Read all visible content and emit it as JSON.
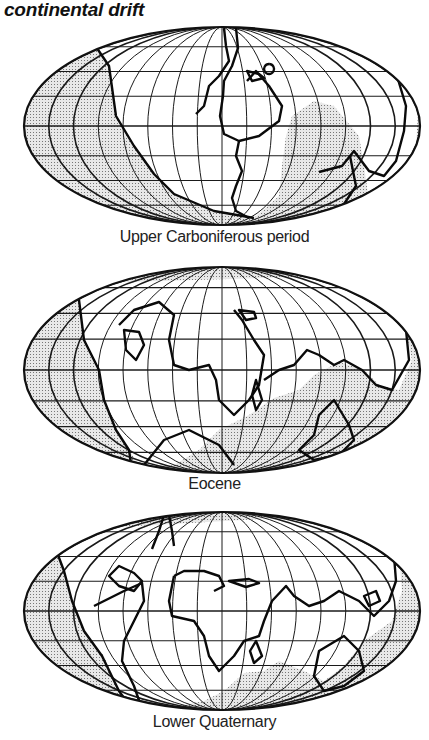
{
  "title": "continental drift",
  "maps": [
    {
      "caption": "Upper Carboniferous period",
      "cx": 222,
      "cy": 126,
      "rx": 198,
      "ry": 99,
      "top": 0,
      "land": [
        "M60,-97 L85,-60 L92,-10 L110,20 L130,48 L150,68 L190,85 L230,92 L255,70 L258,40 L262,10 L268,-10 L290,-25 L310,-20 L335,10 L340,40 L345,75 L365,90 L380,80 L392,20 L395,-30 L380,-70 L350,-95 Z"
      ],
      "coast": [
        "M60,-97 L85,-60 L92,-10 L110,20 L130,48 L150,68 L190,85 L230,92",
        "M200,-98 L202,-80 L205,-65 L195,-50 L185,-40 L180,-20 L172,-12",
        "M212,-98 L214,-78 L208,-60 L200,-45 L199,-30 L196,-10 L200,8 L215,15 L235,10 L255,-5 L258,-20 L245,-40 L232,-55 L223,-45",
        "M215,15 L212,30 L218,45 L212,60 L208,72 L212,85 L225,92",
        "M340,-97 L370,-60 L382,-20 L380,5 L372,35 L360,50 L345,45 L330,25 L318,40 L295,46",
        "M326,30 L332,60 L320,78 L300,90",
        "M223,-55 L235,-52 L240,-48 L228,-45 Z",
        "M245,-62 a5,5 0 1,0 0.1,0"
      ]
    },
    {
      "caption": "Eocene",
      "cx": 222,
      "cy": 370,
      "rx": 198,
      "ry": 103,
      "top": 0,
      "land": [
        "M30,-86 L55,-70 L60,-30 L75,0 L80,30 L90,55 L105,80 L118,100 L150,95 L175,80 L195,60 L225,45 L250,28 L275,20 L290,5 L315,-8 L340,0 L355,15 L375,20 L388,-10 L382,-40 L365,-75 L340,-95 Z"
      ],
      "coast": [
        "M30,-86 L55,-70 L60,-30 L75,0 L80,30 L92,60 L105,80 L108,100",
        "M95,-45 L110,-60 L135,-68 L150,-55 L145,-30 L150,-5 L165,0 L185,-5 L192,10 L195,30 L210,45 L225,30 L235,15 L240,-15 L230,-30 L218,-50 L210,-60",
        "M215,-60 L230,-58 L232,-52 L222,-50 Z",
        "M100,-40 L115,-38 L120,-25 L112,-10 L102,-20 Z",
        "M240,10 L255,0 L270,-5 L283,-20 L295,-15 L310,-5 L320,-10 L338,0 L352,15 L368,20 L385,-10 L382,-40 L366,-75 L345,-93",
        "M120,95 L140,70 L165,60 L195,75 L210,95",
        "M295,45 L310,30 L325,55 L330,70 L315,85 L290,90 L275,80 L290,65 Z",
        "M232,10 L238,30 L232,40 L228,25 Z"
      ]
    },
    {
      "caption": "Lower Quaternary",
      "cx": 222,
      "cy": 611,
      "rx": 198,
      "ry": 99,
      "top": 0,
      "land": [
        "M25,-80 L40,-40 L48,-10 L60,20 L80,45 L95,80 L110,98 L150,96 L180,90 L200,80 L220,62 L240,60 L255,50 L280,60 L300,70 L320,55 L340,30 L368,10 L378,-20 L375,-55 L360,-85 L340,-98 Z"
      ],
      "coast": [
        "M25,-80 L40,-40 L48,-10 L60,20 L78,45 L95,80 L108,98",
        "M85,-35 L95,-45 L110,-38 L118,-30 L110,-20 L95,-25 Z",
        "M128,-62 L135,-80 L140,-96 M145,-96 L148,-80 L150,-65",
        "M70,-5 L100,-20 L118,-28 L120,-10 L110,10 L100,30 L98,50 L110,75 L118,98",
        "M150,-35 L145,-10 L148,5 L170,10 L180,25 L185,45 L195,60 L210,45 L220,30 L235,25 L240,10 L248,-10 L262,-25 L270,-15 L285,-5 L300,-10 L315,-20 L335,-10 L350,5 L365,-10 L372,-30 L370,-55 L358,-85",
        "M150,-35 L160,-40 L180,-40 L195,-35 L200,-25 L190,-20",
        "M205,-30 L225,-32 L235,-28 L222,-24 Z",
        "M232,30 L238,45 L230,52 L226,40 Z",
        "M295,40 L320,25 L335,40 L340,60 L320,75 L300,80 L290,65 Z",
        "M340,-15 L352,-20 L356,-10 L345,-5 Z"
      ]
    }
  ],
  "style": {
    "ocean_fill": "#d9d9d9",
    "land_fill": "#ffffff",
    "grid_color": "#1a1a1a",
    "coast_color": "#0a0a0a"
  }
}
